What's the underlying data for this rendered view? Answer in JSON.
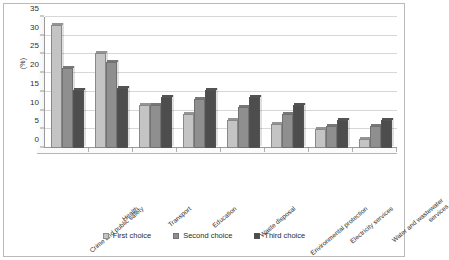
{
  "chart_data": {
    "type": "bar",
    "title": "",
    "subtitle": "",
    "xlabel": "",
    "ylabel": "(%)",
    "ylim": [
      0,
      35
    ],
    "yticks": [
      0,
      5,
      10,
      15,
      20,
      25,
      30,
      35
    ],
    "ytick_labels": [
      "0",
      "5",
      "10",
      "15",
      "20",
      "25",
      "30",
      "35"
    ],
    "grid": "horizontal",
    "legend_position": "bottom",
    "orientation": "vertical",
    "grouping": "clustered",
    "style": "3d-bars-grayscale",
    "categories": [
      "Crime and public safety",
      "Health",
      "Transport",
      "Education",
      "Waste disposal",
      "Environmental protection",
      "Electricity services",
      "Water and wastewater services"
    ],
    "category_label_lines": [
      [
        "Crime and public safety"
      ],
      [
        "Health"
      ],
      [
        "Transport"
      ],
      [
        "Education"
      ],
      [
        "Waste disposal"
      ],
      [
        "Environmental protection"
      ],
      [
        "Electricity services"
      ],
      [
        "Water and wastewater",
        "services"
      ]
    ],
    "series": [
      {
        "name": "First choice",
        "color": "#c4c4c4",
        "values": [
          33,
          25.5,
          11.5,
          9,
          7.5,
          6.5,
          5,
          2.5
        ]
      },
      {
        "name": "Second choice",
        "color": "#8f8f8f",
        "values": [
          21.5,
          23,
          11.5,
          13,
          11,
          9,
          6,
          6
        ]
      },
      {
        "name": "Third choice",
        "color": "#4d4d4d",
        "values": [
          15.5,
          16,
          13.5,
          15.5,
          13.5,
          11.5,
          7.5,
          7.5
        ]
      }
    ],
    "legend": [
      {
        "label": "First choice",
        "color": "#c4c4c4"
      },
      {
        "label": "Second choice",
        "color": "#8f8f8f"
      },
      {
        "label": "Third choice",
        "color": "#4d4d4d"
      }
    ]
  }
}
